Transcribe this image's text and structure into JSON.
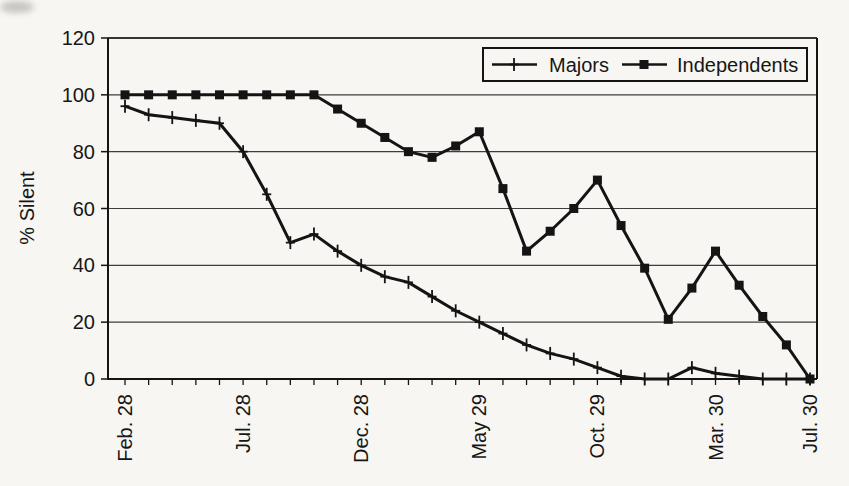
{
  "figure": {
    "ylabel": "% Silent",
    "background_color": "#f7f6f2",
    "line_color": "#141414",
    "grid_color": "#3d3d3d"
  },
  "chart_data": {
    "type": "line",
    "title": "",
    "xlabel": "",
    "ylabel": "% Silent",
    "ylim": [
      0,
      120
    ],
    "y_ticks": [
      0,
      20,
      40,
      60,
      80,
      100,
      120
    ],
    "grid": "horizontal",
    "legend_position": "top-right-inside",
    "categories": [
      "Feb. 28",
      "Mar. 28",
      "Apr. 28",
      "May 28",
      "Jun. 28",
      "Jul. 28",
      "Aug. 28",
      "Sep. 28",
      "Oct. 28",
      "Nov. 28",
      "Dec. 28",
      "Jan. 29",
      "Feb. 29",
      "Mar. 29",
      "Apr. 29",
      "May 29",
      "Jun. 29",
      "Jul. 29",
      "Aug. 29",
      "Sep. 29",
      "Oct. 29",
      "Nov. 29",
      "Dec. 29",
      "Jan. 30",
      "Feb. 30",
      "Mar. 30",
      "Apr. 30",
      "May 30",
      "Jun. 30",
      "Jul. 30"
    ],
    "x_tick_labels": [
      {
        "index": 0,
        "label": "Feb. 28"
      },
      {
        "index": 5,
        "label": "Jul. 28"
      },
      {
        "index": 10,
        "label": "Dec. 28"
      },
      {
        "index": 15,
        "label": "May 29"
      },
      {
        "index": 20,
        "label": "Oct. 29"
      },
      {
        "index": 25,
        "label": "Mar. 30"
      },
      {
        "index": 29,
        "label": "Jul. 30"
      }
    ],
    "series": [
      {
        "name": "Majors",
        "marker": "plus",
        "values": [
          96,
          93,
          92,
          91,
          90,
          80,
          65,
          48,
          51,
          45,
          40,
          36,
          34,
          29,
          24,
          20,
          16,
          12,
          9,
          7,
          4,
          1,
          0,
          0,
          4,
          2,
          1,
          0,
          0,
          0
        ]
      },
      {
        "name": "Independents",
        "marker": "square",
        "values": [
          100,
          100,
          100,
          100,
          100,
          100,
          100,
          100,
          100,
          95,
          90,
          85,
          80,
          78,
          82,
          87,
          67,
          45,
          52,
          60,
          70,
          54,
          39,
          21,
          32,
          45,
          33,
          22,
          12,
          0
        ]
      }
    ]
  }
}
